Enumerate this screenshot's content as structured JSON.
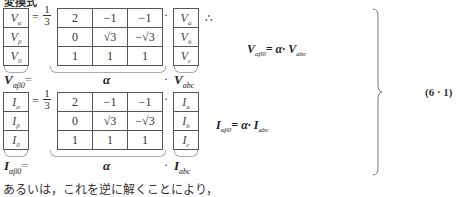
{
  "title": "変換式",
  "block_v": {
    "lhs_vector": [
      {
        "base": "V",
        "sub": "α"
      },
      {
        "base": "V",
        "sub": "β"
      },
      {
        "base": "V",
        "sub": "0"
      }
    ],
    "equals": "=",
    "scalar_num": "1",
    "scalar_den": "3",
    "matrix": [
      [
        "2",
        "−1",
        "−1"
      ],
      [
        "0",
        "√3",
        "−√3"
      ],
      [
        "1",
        "1",
        "1"
      ]
    ],
    "dot": "·",
    "rhs_vector": [
      {
        "base": "V",
        "sub": "a"
      },
      {
        "base": "V",
        "sub": "b"
      },
      {
        "base": "V",
        "sub": "c"
      }
    ],
    "label_lhs_base": "V",
    "label_lhs_sub": "αβ0",
    "label_eq": "=",
    "label_matrix": "α",
    "label_dot": "·",
    "label_rhs_base": "V",
    "label_rhs_sub": "abc",
    "therefore": "∴",
    "relation": {
      "lhs_base": "V",
      "lhs_sub": "αβ0",
      "mid": "= α· ",
      "rhs_base": "V",
      "rhs_sub": "abc"
    }
  },
  "block_i": {
    "lhs_vector": [
      {
        "base": "I",
        "sub": "α"
      },
      {
        "base": "I",
        "sub": "β"
      },
      {
        "base": "I",
        "sub": "0"
      }
    ],
    "equals": "=",
    "scalar_num": "1",
    "scalar_den": "3",
    "matrix": [
      [
        "2",
        "−1",
        "−1"
      ],
      [
        "0",
        "√3",
        "−√3"
      ],
      [
        "1",
        "1",
        "1"
      ]
    ],
    "dot": "·",
    "rhs_vector": [
      {
        "base": "I",
        "sub": "a"
      },
      {
        "base": "I",
        "sub": "b"
      },
      {
        "base": "I",
        "sub": "c"
      }
    ],
    "label_lhs_base": "I",
    "label_lhs_sub": "αβ0",
    "label_eq": "=",
    "label_matrix": "α",
    "label_dot": "·",
    "label_rhs_base": "I",
    "label_rhs_sub": "abc",
    "relation": {
      "lhs_base": "I",
      "lhs_sub": "αβ0",
      "mid": "= α· ",
      "rhs_base": "I",
      "rhs_sub": "abc"
    }
  },
  "equation_number": "(6 · 1)",
  "footer_text": "あるいは，これを逆に解くことにより，"
}
